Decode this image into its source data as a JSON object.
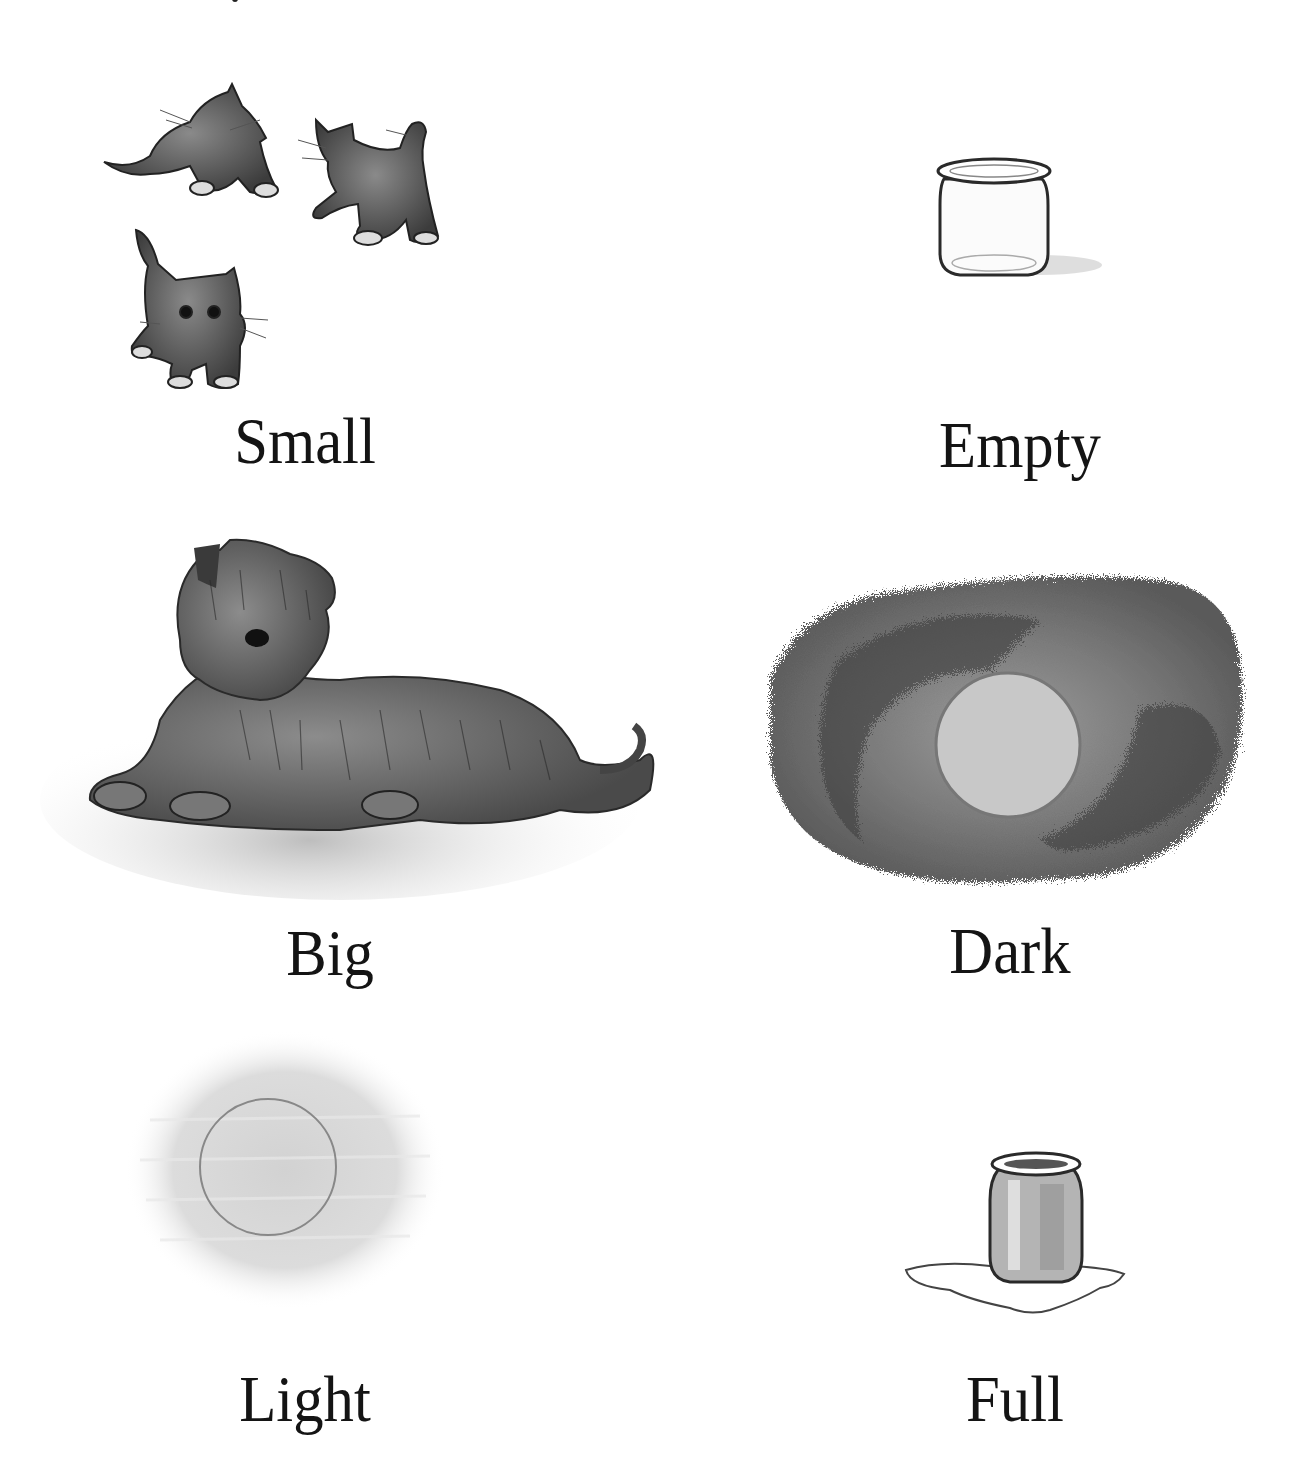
{
  "page": {
    "type": "opposites-picture-page",
    "items": [
      {
        "word": "Small",
        "illustration": "three-kittens-illustration",
        "column": "left",
        "row": 1
      },
      {
        "word": "Empty",
        "illustration": "empty-jar-illustration",
        "column": "right",
        "row": 1
      },
      {
        "word": "Big",
        "illustration": "shaggy-dog-illustration",
        "column": "left",
        "row": 2
      },
      {
        "word": "Dark",
        "illustration": "dark-night-moon-illustration",
        "column": "right",
        "row": 2
      },
      {
        "word": "Light",
        "illustration": "light-sun-illustration",
        "column": "left",
        "row": 3
      },
      {
        "word": "Full",
        "illustration": "full-jar-illustration",
        "column": "right",
        "row": 3
      }
    ]
  },
  "colors": {
    "background": "#ffffff",
    "text": "#141414",
    "ink": "#2a2a2a",
    "wash_dark": "#4a4a4a",
    "wash_light": "#c8c8c8"
  }
}
